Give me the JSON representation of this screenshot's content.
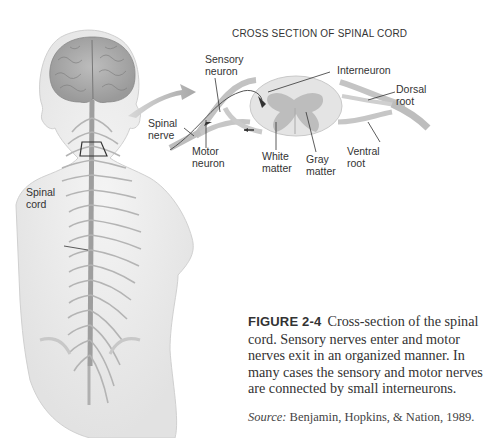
{
  "figure": {
    "diagram_title": "CROSS SECTION OF SPINAL CORD",
    "labels": {
      "sensory_neuron": [
        "Sensory",
        "neuron"
      ],
      "interneuron": "Interneuron",
      "dorsal_root": [
        "Dorsal",
        "root"
      ],
      "spinal_nerve": [
        "Spinal",
        "nerve"
      ],
      "motor_neuron": [
        "Motor",
        "neuron"
      ],
      "white_matter": [
        "White",
        "matter"
      ],
      "gray_matter": [
        "Gray",
        "matter"
      ],
      "ventral_root": [
        "Ventral",
        "root"
      ],
      "spinal_cord": [
        "Spinal",
        "cord"
      ]
    },
    "caption": {
      "figure_number": "FIGURE 2-4",
      "text": "Cross-section of the spinal cord. Sensory nerves enter and motor nerves exit in an organized manner. In many cases the sensory and motor nerves are connected by small interneurons."
    },
    "source": {
      "label": "Source:",
      "text": " Benjamin, Hopkins, & Nation, 1989."
    }
  }
}
